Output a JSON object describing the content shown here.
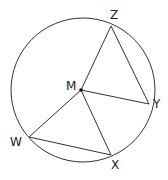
{
  "diagram": {
    "type": "circle-geometry",
    "circle": {
      "center": [
        83,
        90
      ],
      "radius": 72
    },
    "center_point": {
      "label": "M",
      "x": 81,
      "y": 90
    },
    "points": [
      {
        "label": "Z",
        "x": 111,
        "y": 26
      },
      {
        "label": "Y",
        "x": 149,
        "y": 104
      },
      {
        "label": "X",
        "x": 111,
        "y": 155
      },
      {
        "label": "W",
        "x": 29,
        "y": 137
      }
    ],
    "segments": [
      [
        "M",
        "Z"
      ],
      [
        "M",
        "Y"
      ],
      [
        "M",
        "X"
      ],
      [
        "M",
        "W"
      ],
      [
        "Z",
        "Y"
      ],
      [
        "W",
        "X"
      ]
    ],
    "stroke_color": "#333333"
  },
  "labels": {
    "M": "M",
    "Z": "Z",
    "Y": "Y",
    "X": "X",
    "W": "W"
  }
}
